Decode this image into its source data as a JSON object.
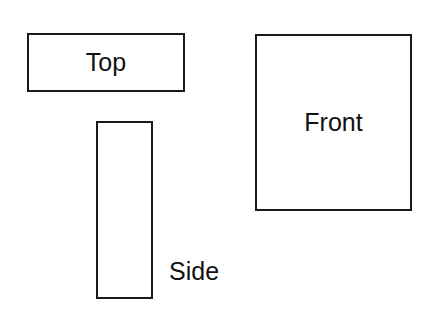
{
  "diagram": {
    "views": [
      {
        "id": "top",
        "label": "Top"
      },
      {
        "id": "front",
        "label": "Front"
      },
      {
        "id": "side",
        "label": "Side"
      }
    ],
    "stroke_color": "#1a1a1a",
    "background_color": "#ffffff"
  }
}
